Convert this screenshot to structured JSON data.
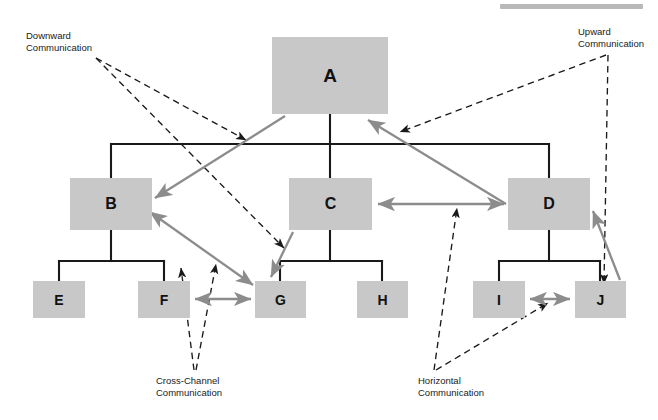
{
  "figure": {
    "background_color": "#ffffff",
    "box_fill_color": "#c8c8c8",
    "structural_line_color": "#1a1a1a",
    "communication_arrow_color": "#8c8c8c",
    "annotation_leader_color": "#1a1a1a"
  },
  "top_rule": {
    "name": "header-rule",
    "color": "#b9b9b9",
    "x": 500,
    "y": 4,
    "width": 143,
    "height": 5
  },
  "nodes": [
    {
      "id": "A",
      "label": "A",
      "level": 1,
      "x": 272,
      "y": 37,
      "width": 116,
      "height": 77
    },
    {
      "id": "B",
      "label": "B",
      "level": 2,
      "x": 70,
      "y": 178,
      "width": 82,
      "height": 52
    },
    {
      "id": "C",
      "label": "C",
      "level": 2,
      "x": 289,
      "y": 178,
      "width": 83,
      "height": 52
    },
    {
      "id": "D",
      "label": "D",
      "level": 2,
      "x": 508,
      "y": 178,
      "width": 82,
      "height": 52
    },
    {
      "id": "E",
      "label": "E",
      "level": 3,
      "x": 33,
      "y": 281,
      "width": 52,
      "height": 37
    },
    {
      "id": "F",
      "label": "F",
      "level": 3,
      "x": 138,
      "y": 281,
      "width": 52,
      "height": 37
    },
    {
      "id": "G",
      "label": "G",
      "level": 3,
      "x": 255,
      "y": 281,
      "width": 51,
      "height": 37
    },
    {
      "id": "H",
      "label": "H",
      "level": 3,
      "x": 357,
      "y": 281,
      "width": 51,
      "height": 37
    },
    {
      "id": "I",
      "label": "I",
      "level": 3,
      "x": 473,
      "y": 281,
      "width": 52,
      "height": 37
    },
    {
      "id": "J",
      "label": "J",
      "level": 3,
      "x": 575,
      "y": 281,
      "width": 51,
      "height": 37
    }
  ],
  "hierarchy_edges": [
    {
      "name": "edge-a-to-bus",
      "points": "330,114 330,144"
    },
    {
      "name": "edge-bus-top",
      "points": "111,144 549,144"
    },
    {
      "name": "edge-bus-to-b",
      "points": "111,144 111,178"
    },
    {
      "name": "edge-bus-to-c",
      "points": "330,144 330,178"
    },
    {
      "name": "edge-bus-to-d",
      "points": "549,144 549,178"
    },
    {
      "name": "edge-b-to-bus2",
      "points": "111,230 111,261"
    },
    {
      "name": "edge-bus2-b",
      "points": "59,261 164,261"
    },
    {
      "name": "edge-bus2-to-e",
      "points": "59,261 59,281"
    },
    {
      "name": "edge-bus2-to-f",
      "points": "164,261 164,281"
    },
    {
      "name": "edge-c-to-bus3",
      "points": "330,230 330,261"
    },
    {
      "name": "edge-bus3-c",
      "points": "280,261 382,261"
    },
    {
      "name": "edge-bus3-to-g",
      "points": "280,261 280,281"
    },
    {
      "name": "edge-bus3-to-h",
      "points": "382,261 382,281"
    },
    {
      "name": "edge-d-to-bus4",
      "points": "549,230 549,261"
    },
    {
      "name": "edge-bus4-d",
      "points": "499,261 600,261"
    },
    {
      "name": "edge-bus4-to-i",
      "points": "499,261 499,281"
    },
    {
      "name": "edge-bus4-to-j",
      "points": "600,261 600,281"
    }
  ],
  "communication_arrows": [
    {
      "name": "arrow-downward-a-to-b",
      "kind": "downward",
      "from": "A",
      "to": "B",
      "x1": 285,
      "y1": 116,
      "x2": 155,
      "y2": 198,
      "double_headed": false
    },
    {
      "name": "arrow-downward-b-to-g",
      "kind": "cross-channel-diagonal",
      "from": "B",
      "to": "G",
      "x1": 150,
      "y1": 212,
      "x2": 253,
      "y2": 285,
      "double_headed": true
    },
    {
      "name": "arrow-downward-c-to-g",
      "kind": "downward",
      "from": "C",
      "to": "G",
      "x1": 293,
      "y1": 232,
      "x2": 271,
      "y2": 277,
      "double_headed": false
    },
    {
      "name": "arrow-upward-d-to-a",
      "kind": "upward",
      "from": "D",
      "to": "A",
      "x1": 506,
      "y1": 204,
      "x2": 368,
      "y2": 120,
      "double_headed": false
    },
    {
      "name": "arrow-upward-j-to-d",
      "kind": "upward",
      "from": "J",
      "to": "D",
      "x1": 620,
      "y1": 280,
      "x2": 593,
      "y2": 211,
      "double_headed": false
    },
    {
      "name": "arrow-horizontal-c-to-d",
      "kind": "horizontal",
      "from": "C",
      "to": "D",
      "x1": 378,
      "y1": 204,
      "x2": 504,
      "y2": 204,
      "double_headed": true
    },
    {
      "name": "arrow-horizontal-i-to-j",
      "kind": "horizontal",
      "from": "I",
      "to": "J",
      "x1": 530,
      "y1": 299,
      "x2": 570,
      "y2": 299,
      "double_headed": true
    },
    {
      "name": "arrow-horizontal-f-to-g",
      "kind": "horizontal",
      "from": "F",
      "to": "G",
      "x1": 195,
      "y1": 299,
      "x2": 251,
      "y2": 299,
      "double_headed": true
    }
  ],
  "annotations": [
    {
      "name": "label-downward-communication",
      "text": "Downward\nCommunication",
      "x": 26,
      "y": 30,
      "align": "left",
      "leaders": [
        {
          "name": "leader-downward-1",
          "x1": 96,
          "y1": 58,
          "x2": 246,
          "y2": 140
        },
        {
          "name": "leader-downward-2",
          "x1": 96,
          "y1": 58,
          "x2": 284,
          "y2": 248
        }
      ]
    },
    {
      "name": "label-upward-communication",
      "text": "Upward\nCommunication",
      "x": 578,
      "y": 26,
      "align": "left",
      "leaders": [
        {
          "name": "leader-upward-1",
          "x1": 606,
          "y1": 55,
          "x2": 400,
          "y2": 132
        },
        {
          "name": "leader-upward-2",
          "x1": 608,
          "y1": 55,
          "x2": 604,
          "y2": 284
        }
      ]
    },
    {
      "name": "label-cross-channel-communication",
      "text": "Cross-Channel\nCommunication",
      "x": 156,
      "y": 375,
      "align": "left",
      "leaders": [
        {
          "name": "leader-cross-1",
          "x1": 194,
          "y1": 370,
          "x2": 181,
          "y2": 268
        },
        {
          "name": "leader-cross-2",
          "x1": 196,
          "y1": 370,
          "x2": 216,
          "y2": 264
        }
      ]
    },
    {
      "name": "label-horizontal-communication",
      "text": "Horizontal\nCommunication",
      "x": 418,
      "y": 375,
      "align": "left",
      "leaders": [
        {
          "name": "leader-horizontal-1",
          "x1": 434,
          "y1": 370,
          "x2": 457,
          "y2": 208
        },
        {
          "name": "leader-horizontal-2",
          "x1": 436,
          "y1": 370,
          "x2": 548,
          "y2": 303
        }
      ]
    }
  ]
}
